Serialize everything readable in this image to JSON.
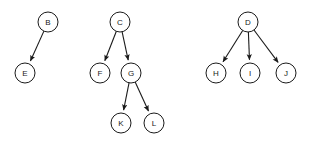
{
  "diagram": {
    "type": "directed-graph",
    "background_color": "#ffffff",
    "node_fill_color": "#ffffff",
    "node_stroke_color": "#1a1a1a",
    "edge_color": "#1a1a1a",
    "label_color": "#1a1a1a",
    "node_radius": 10,
    "canvas": {
      "width": 312,
      "height": 143
    },
    "nodes": [
      {
        "id": "B",
        "label": "B",
        "x": 48,
        "y": 22
      },
      {
        "id": "E",
        "label": "E",
        "x": 25,
        "y": 73
      },
      {
        "id": "C",
        "label": "C",
        "x": 120,
        "y": 22
      },
      {
        "id": "F",
        "label": "F",
        "x": 100,
        "y": 73
      },
      {
        "id": "G",
        "label": "G",
        "x": 131,
        "y": 73
      },
      {
        "id": "K",
        "label": "K",
        "x": 121,
        "y": 123
      },
      {
        "id": "L",
        "label": "L",
        "x": 154,
        "y": 123
      },
      {
        "id": "D",
        "label": "D",
        "x": 248,
        "y": 22
      },
      {
        "id": "H",
        "label": "H",
        "x": 216,
        "y": 73
      },
      {
        "id": "I",
        "label": "I",
        "x": 250,
        "y": 73
      },
      {
        "id": "J",
        "label": "J",
        "x": 286,
        "y": 73
      }
    ],
    "edges": [
      {
        "from": "B",
        "to": "E",
        "directed": true
      },
      {
        "from": "C",
        "to": "F",
        "directed": true
      },
      {
        "from": "C",
        "to": "G",
        "directed": true
      },
      {
        "from": "G",
        "to": "K",
        "directed": true
      },
      {
        "from": "G",
        "to": "L",
        "directed": true
      },
      {
        "from": "D",
        "to": "H",
        "directed": true
      },
      {
        "from": "D",
        "to": "I",
        "directed": true
      },
      {
        "from": "D",
        "to": "J",
        "directed": true
      }
    ],
    "components": [
      {
        "root": "B",
        "members": [
          "B",
          "E"
        ]
      },
      {
        "root": "C",
        "members": [
          "C",
          "F",
          "G",
          "K",
          "L"
        ]
      },
      {
        "root": "D",
        "members": [
          "D",
          "H",
          "I",
          "J"
        ]
      }
    ]
  }
}
